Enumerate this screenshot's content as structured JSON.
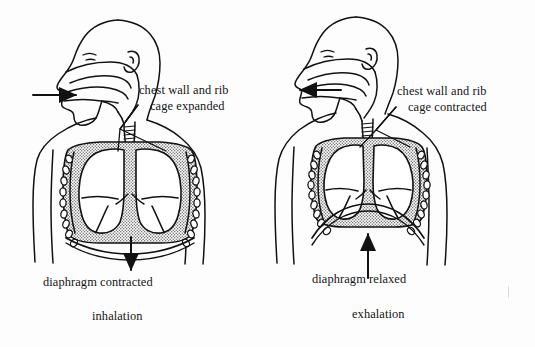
{
  "diagram": {
    "type": "anatomical-line-diagram",
    "stroke_color": "#111111",
    "fill_background": "#ffffff",
    "pleural_fill_color": "#b9b9b9",
    "panel_count": 2
  },
  "panels": [
    {
      "id": "inhalation",
      "caption": "inhalation",
      "airflow_arrow": {
        "direction": "right",
        "meaning": "air flows in through the nose",
        "x_start": 33,
        "x_end": 78,
        "y": 95
      },
      "diaphragm_arrow": {
        "direction": "down",
        "meaning": "diaphragm moves downward",
        "x": 131,
        "y_start": 237,
        "y_end": 272
      },
      "callout": {
        "line1": "chest wall and rib",
        "line2": "cage expanded"
      },
      "diaphragm_label": "diaphragm contracted",
      "diaphragm_shape": "flattened",
      "ribcage_state": "expanded",
      "rib_count_per_side": 9
    },
    {
      "id": "exhalation",
      "caption": "exhalation",
      "airflow_arrow": {
        "direction": "left",
        "meaning": "air flows out through the nose",
        "x_start": 73,
        "x_end": 30,
        "y": 90
      },
      "diaphragm_arrow": {
        "direction": "up",
        "meaning": "diaphragm moves upward",
        "x": 100,
        "y_start": 280,
        "y_end": 232
      },
      "callout": {
        "line1": "chest wall and rib",
        "line2": "cage contracted"
      },
      "diaphragm_label": "diaphragm relaxed",
      "diaphragm_shape": "domed",
      "ribcage_state": "contracted",
      "rib_count_per_side": 9
    }
  ],
  "anatomy_parts": [
    "head-profile",
    "nasal-cavity",
    "pharynx",
    "trachea",
    "bronchi",
    "left-lung",
    "right-lung",
    "rib-cross-sections",
    "diaphragm",
    "chest-wall",
    "shoulder",
    "arm"
  ]
}
